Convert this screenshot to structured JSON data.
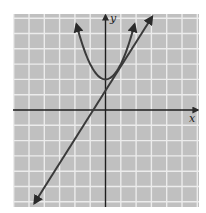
{
  "chart_data": {
    "type": "line",
    "title": "",
    "xlabel": "x",
    "ylabel": "y",
    "xlim": [
      -6,
      6
    ],
    "ylim": [
      -6.3,
      6.2
    ],
    "grid": true,
    "legend": null,
    "tick_labels": false,
    "unit_px": 15.3,
    "origin_px": [
      105.5,
      110
    ],
    "series": [
      {
        "name": "parabola",
        "equation": "y = x^2 + 2",
        "vertex": [
          0,
          2
        ],
        "x": [
          -1.9,
          -1.5,
          -1,
          -0.5,
          0,
          0.5,
          1,
          1.5,
          1.9
        ],
        "y": [
          5.61,
          4.25,
          3,
          2.25,
          2,
          2.25,
          3,
          4.25,
          5.61
        ],
        "arrows": "both ends"
      },
      {
        "name": "tangent line",
        "equation": "y = 1.6x + 1.3",
        "x": [
          -4.65,
          3.05
        ],
        "y": [
          -6.1,
          6.1
        ],
        "tangent_point": [
          0.8,
          2.64
        ],
        "arrows": "both ends"
      }
    ]
  },
  "labels": {
    "x_axis": "x",
    "y_axis": "y"
  },
  "colors": {
    "background": "#c0c0c0",
    "grid": "#ececec",
    "axes": "#1e1e1e",
    "curves": "#3a3a3a",
    "page": "#ffffff"
  }
}
